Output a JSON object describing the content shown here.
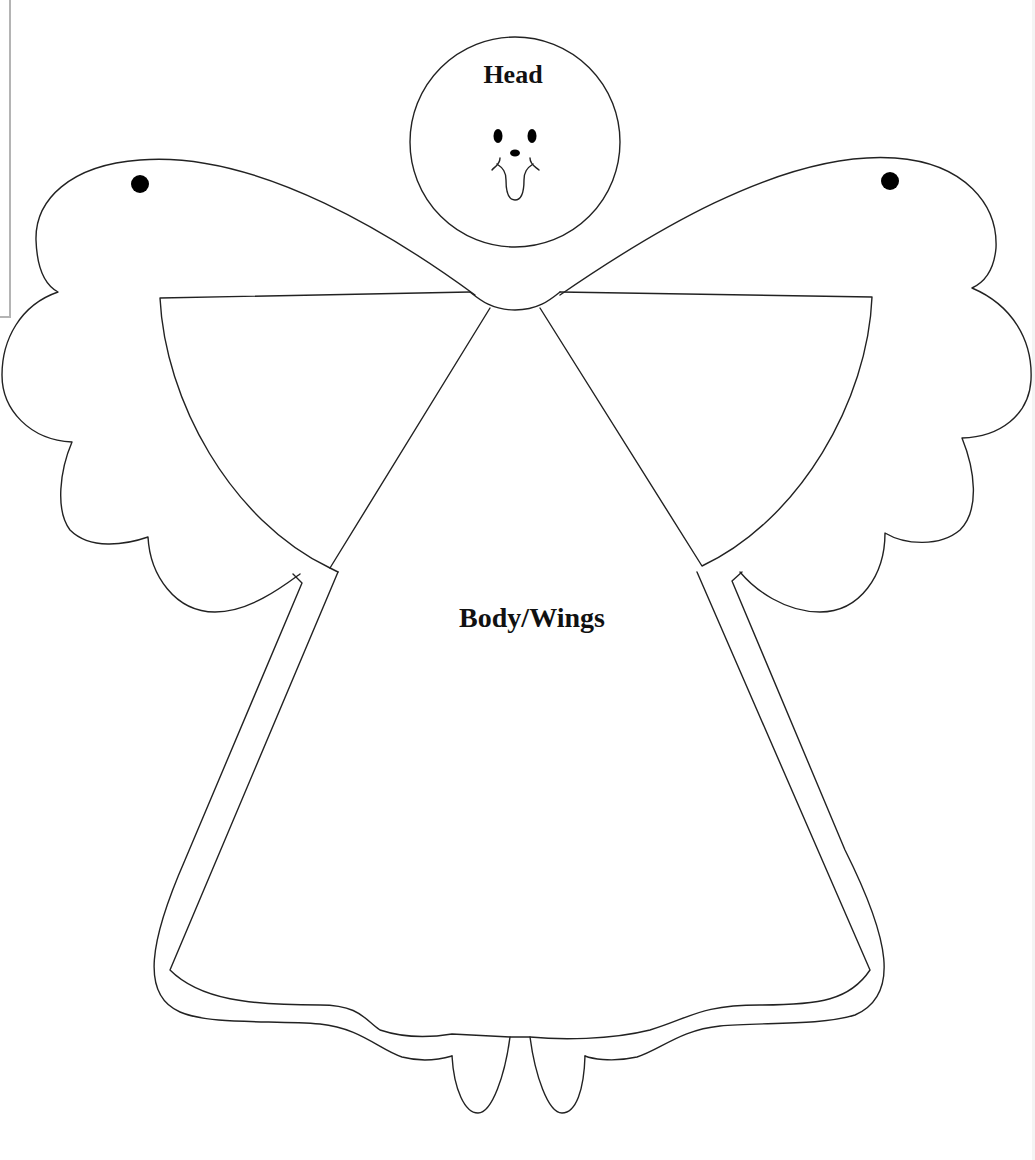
{
  "template": {
    "title": "Angel pattern",
    "pieces": [
      {
        "id": "head",
        "label": "Head"
      },
      {
        "id": "body",
        "label": "Body/Wings"
      }
    ],
    "colors": {
      "outline": "#222222",
      "fill": "#ffffff",
      "marks": "#000000",
      "frame": "#b4b4b4"
    }
  }
}
